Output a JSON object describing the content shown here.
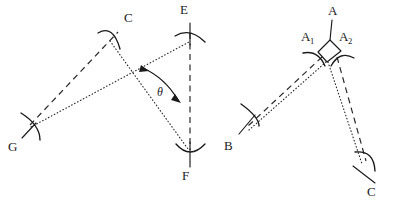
{
  "figure": {
    "panels": [
      {
        "id": "left-panel",
        "name": "angle-theta-construction",
        "labels": [
          {
            "key": "C",
            "text": "C",
            "x": 124,
            "y": 22,
            "name": "vertex-label-c"
          },
          {
            "key": "E",
            "text": "E",
            "x": 180,
            "y": 14,
            "name": "vertex-label-e"
          },
          {
            "key": "G",
            "text": "G",
            "x": 8,
            "y": 151,
            "name": "vertex-label-g"
          },
          {
            "key": "F",
            "text": "F",
            "x": 182,
            "y": 180,
            "name": "vertex-label-f"
          }
        ],
        "angle_label": {
          "text": "θ",
          "x": 157,
          "y": 96,
          "name": "angle-label-theta"
        }
      },
      {
        "id": "right-panel",
        "name": "angle-bisector-construction",
        "labels": [
          {
            "key": "A",
            "text": "A",
            "x": 331,
            "y": 15,
            "name": "vertex-label-a"
          },
          {
            "key": "A1",
            "text": "A",
            "sub": "1",
            "x": 306,
            "y": 41,
            "name": "vertex-label-a1"
          },
          {
            "key": "A2",
            "text": "A",
            "sub": "2",
            "x": 342,
            "y": 41,
            "name": "vertex-label-a2"
          },
          {
            "key": "B",
            "text": "B",
            "x": 226,
            "y": 150,
            "name": "vertex-label-b"
          },
          {
            "key": "C",
            "text": "C",
            "x": 369,
            "y": 196,
            "name": "vertex-label-c-right"
          }
        ]
      }
    ],
    "colors": {
      "ink": "#1a1a1a",
      "construction": "#2a2a2a",
      "background": "#ffffff"
    },
    "line_styles": {
      "solid": "solid",
      "dashed": "dashed",
      "dotted": "dotted"
    },
    "geometry": {
      "left": {
        "C": [
          113,
          37
        ],
        "G": [
          30,
          126
        ],
        "E": [
          190,
          30
        ],
        "F": [
          190,
          151
        ],
        "crossing": [
          128,
          70
        ]
      },
      "right": {
        "apex": [
          327,
          62
        ],
        "A": [
          332,
          28
        ],
        "B": [
          249,
          128
        ],
        "C": [
          364,
          165
        ]
      }
    }
  }
}
